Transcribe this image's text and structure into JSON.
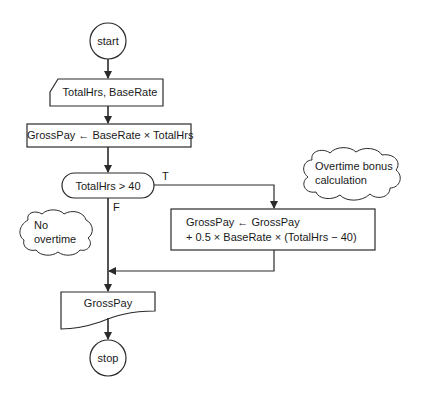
{
  "flowchart": {
    "start": {
      "label": "start"
    },
    "input": {
      "label": "TotalHrs, BaseRate"
    },
    "process1": {
      "label": "GrossPay ← BaseRate × TotalHrs"
    },
    "decision": {
      "label": "TotalHrs > 40",
      "true_label": "T",
      "false_label": "F"
    },
    "process2": {
      "line1": "GrossPay ← GrossPay",
      "line2": "+ 0.5 × BaseRate × (TotalHrs − 40)"
    },
    "comment_true": {
      "line1": "Overtime bonus",
      "line2": "calculation"
    },
    "comment_false": {
      "line1": "No",
      "line2": "overtime"
    },
    "output": {
      "label": "GrossPay"
    },
    "stop": {
      "label": "stop"
    }
  },
  "colors": {
    "stroke": "#2a2a2a",
    "background": "#ffffff"
  }
}
